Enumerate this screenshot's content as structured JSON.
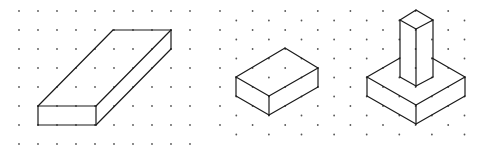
{
  "diagram": {
    "type": "isometric-drawings-on-dot-paper",
    "colors": {
      "background": "#ffffff",
      "line": "#1a1a1a",
      "dot": "#555555"
    },
    "figures": [
      {
        "name": "square-grid-oblique-slab",
        "grid": "square",
        "description": "Oblique rectangular slab drawn on square dot grid",
        "edges": [
          [
            [
              38,
              106
            ],
            [
              96,
              106
            ]
          ],
          [
            [
              96,
              106
            ],
            [
              96,
              125
            ]
          ],
          [
            [
              96,
              125
            ],
            [
              38,
              125
            ]
          ],
          [
            [
              38,
              125
            ],
            [
              38,
              106
            ]
          ],
          [
            [
              38,
              106
            ],
            [
              113,
              30
            ]
          ],
          [
            [
              113,
              30
            ],
            [
              171,
              30
            ]
          ],
          [
            [
              171,
              30
            ],
            [
              96,
              106
            ]
          ],
          [
            [
              171,
              30
            ],
            [
              171,
              49
            ]
          ],
          [
            [
              171,
              49
            ],
            [
              96,
              125
            ]
          ]
        ]
      },
      {
        "name": "isometric-cuboid",
        "grid": "isometric",
        "description": "Cuboid drawn on isometric dot grid",
        "edges": [
          [
            [
              236,
              77
            ],
            [
              285,
              48
            ]
          ],
          [
            [
              285,
              48
            ],
            [
              318,
              68
            ]
          ],
          [
            [
              318,
              68
            ],
            [
              269,
              96
            ]
          ],
          [
            [
              269,
              96
            ],
            [
              236,
              77
            ]
          ],
          [
            [
              236,
              77
            ],
            [
              236,
              96
            ]
          ],
          [
            [
              236,
              96
            ],
            [
              269,
              115
            ]
          ],
          [
            [
              269,
              115
            ],
            [
              269,
              96
            ]
          ],
          [
            [
              269,
              115
            ],
            [
              318,
              87
            ]
          ],
          [
            [
              318,
              87
            ],
            [
              318,
              68
            ]
          ]
        ]
      },
      {
        "name": "isometric-pillar-on-base",
        "grid": "isometric",
        "description": "Tall square pillar standing on a square base block",
        "edges": [
          [
            [
              367,
              77
            ],
            [
              400,
              58
            ]
          ],
          [
            [
              432,
              58
            ],
            [
              465,
              77
            ]
          ],
          [
            [
              465,
              77
            ],
            [
              416,
              105
            ]
          ],
          [
            [
              416,
              105
            ],
            [
              367,
              77
            ]
          ],
          [
            [
              367,
              77
            ],
            [
              367,
              96
            ]
          ],
          [
            [
              367,
              96
            ],
            [
              416,
              124
            ]
          ],
          [
            [
              416,
              124
            ],
            [
              416,
              105
            ]
          ],
          [
            [
              416,
              124
            ],
            [
              465,
              96
            ]
          ],
          [
            [
              465,
              96
            ],
            [
              465,
              77
            ]
          ],
          [
            [
              416,
              10
            ],
            [
              433,
              20
            ]
          ],
          [
            [
              433,
              20
            ],
            [
              416,
              29
            ]
          ],
          [
            [
              416,
              29
            ],
            [
              400,
              20
            ]
          ],
          [
            [
              400,
              20
            ],
            [
              416,
              10
            ]
          ],
          [
            [
              400,
              20
            ],
            [
              400,
              77
            ]
          ],
          [
            [
              416,
              29
            ],
            [
              416,
              86
            ]
          ],
          [
            [
              433,
              20
            ],
            [
              433,
              77
            ]
          ],
          [
            [
              400,
              77
            ],
            [
              416,
              86
            ]
          ],
          [
            [
              416,
              86
            ],
            [
              433,
              77
            ]
          ]
        ]
      }
    ],
    "square_grid": {
      "x0": 19,
      "y0": 11,
      "spacing": 19,
      "cols": 10,
      "rows": 8
    },
    "iso_grid": {
      "x0": 220,
      "y0": 11,
      "dx": 16.3,
      "dy": 9.5,
      "cols": 16,
      "rows": 14
    }
  }
}
